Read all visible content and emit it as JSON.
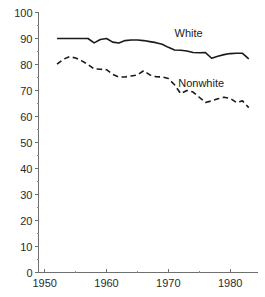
{
  "chart_data": {
    "type": "line",
    "title": "",
    "subtitle": "",
    "xlabel": "",
    "ylabel": "",
    "xlim": [
      1949.0,
      1984.5
    ],
    "ylim": [
      0,
      100
    ],
    "grid": false,
    "legend_position": "inline-annotation",
    "x_ticks": [
      1950,
      1960,
      1970,
      1980
    ],
    "x_tick_labels": [
      "1950",
      "1960",
      "1970",
      "1980"
    ],
    "x_minor_ticks": [
      1955,
      1965,
      1975
    ],
    "y_ticks": [
      0,
      10,
      20,
      30,
      40,
      50,
      60,
      70,
      80,
      90,
      100
    ],
    "y_tick_labels": [
      "0",
      "10",
      "20",
      "30",
      "40",
      "50",
      "60",
      "70",
      "80",
      "90",
      "100"
    ],
    "y_minor_ticks": [
      5,
      15,
      25,
      35,
      45,
      55,
      65,
      75,
      85,
      95
    ],
    "x": [
      1952,
      1953,
      1954,
      1955,
      1956,
      1957,
      1958,
      1959,
      1960,
      1961,
      1962,
      1963,
      1964,
      1965,
      1966,
      1967,
      1968,
      1969,
      1970,
      1971,
      1972,
      1973,
      1974,
      1975,
      1976,
      1977,
      1978,
      1979,
      1980,
      1981,
      1982,
      1983
    ],
    "series": [
      {
        "name": "White",
        "style": "solid",
        "color": "#1a1a1a",
        "label_x": 1971.0,
        "label_y": 90.5,
        "values": [
          90.0,
          90.0,
          90.0,
          90.0,
          90.0,
          90.0,
          88.3,
          89.6,
          90.0,
          88.6,
          88.3,
          89.2,
          89.4,
          89.4,
          89.2,
          88.8,
          88.4,
          87.8,
          86.6,
          85.6,
          85.5,
          85.2,
          84.6,
          84.5,
          84.6,
          82.4,
          83.2,
          83.8,
          84.2,
          84.3,
          84.3,
          82.2
        ]
      },
      {
        "name": "Nonwhite",
        "style": "dashed",
        "color": "#1a1a1a",
        "label_x": 1971.6,
        "label_y": 71.5,
        "values": [
          80.1,
          82.0,
          83.0,
          82.5,
          81.4,
          80.0,
          78.3,
          78.2,
          78.0,
          76.2,
          75.2,
          75.2,
          75.6,
          76.0,
          77.6,
          76.0,
          75.3,
          75.2,
          74.6,
          72.2,
          68.8,
          70.0,
          69.4,
          67.4,
          65.4,
          66.0,
          66.8,
          67.4,
          67.0,
          65.4,
          66.0,
          63.4
        ]
      }
    ]
  }
}
